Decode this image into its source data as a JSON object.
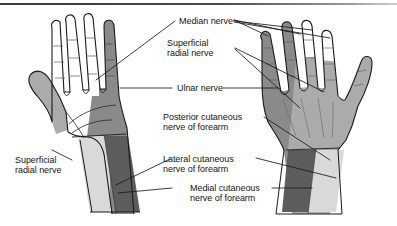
{
  "figure": {
    "view_left": "palmar view of left hand",
    "view_right": "dorsal view of right hand",
    "background_color": "#ffffff",
    "rule_color": "#3b3b3b"
  },
  "palette": {
    "outline": "#1a1a1a",
    "unshaded": "#ffffff",
    "light_gray": "#d9d9d9",
    "mid_gray": "#ababab",
    "dark_gray": "#8a8a8a",
    "darkest_gray": "#5c5c5c",
    "leader_line": "#1a1a1a",
    "text": "#151515"
  },
  "labels": {
    "median_nerve": "Median nerve",
    "superficial_radial_nerve": "Superficial\nradial nerve",
    "superficial_radial_nerve_l1": "Superficial",
    "superficial_radial_nerve_l2": "radial nerve",
    "ulnar_nerve": "Ulnar nerve",
    "posterior_cutaneous_l1": "Posterior cutaneous",
    "posterior_cutaneous_l2": "nerve of forearm",
    "lateral_cutaneous_l1": "Lateral cutaneous",
    "lateral_cutaneous_l2": "nerve of forearm",
    "medial_cutaneous_l1": "Medial cutaneous",
    "medial_cutaneous_l2": "nerve of forearm",
    "superficial_radial_left_l1": "Superficial",
    "superficial_radial_left_l2": "radial nerve"
  },
  "nerve_territories": [
    {
      "name": "Median nerve",
      "shade": "#ffffff",
      "region": "palmar thumb, index, middle, radial half of ring finger and central palm"
    },
    {
      "name": "Ulnar nerve",
      "shade": "#8a8a8a",
      "region": "little finger and ulnar half of ring finger, ulnar palm and dorsum"
    },
    {
      "name": "Superficial radial nerve",
      "shade": "#ababab",
      "region": "dorsum of hand, radial side, thumb and proximal dorsal fingers"
    },
    {
      "name": "Posterior cutaneous nerve of forearm",
      "shade": "#d9d9d9",
      "region": "posterior forearm strip"
    },
    {
      "name": "Lateral cutaneous nerve of forearm",
      "shade": "#d9d9d9",
      "region": "lateral forearm strip"
    },
    {
      "name": "Medial cutaneous nerve of forearm",
      "shade": "#5c5c5c",
      "region": "medial forearm strip"
    }
  ]
}
